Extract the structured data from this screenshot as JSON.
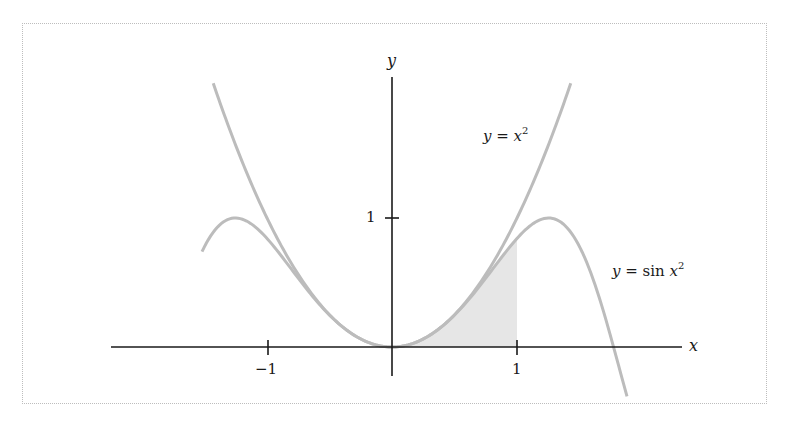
{
  "chart_data": {
    "type": "line",
    "title": "",
    "xlabel": "x",
    "ylabel": "y",
    "x_ticks": [
      -1,
      1
    ],
    "x_tick_labels": [
      "−1",
      "1"
    ],
    "y_ticks": [
      1
    ],
    "y_tick_labels": [
      "1"
    ],
    "xlim": [
      -2.25,
      2.32
    ],
    "ylim": [
      -0.23,
      2.1
    ],
    "grid": false,
    "legend": "none (curves labeled inline)",
    "series": [
      {
        "name": "y = x²",
        "function": "x^2",
        "x_range": [
          -1.43,
          1.43
        ],
        "color": "#b9b9b9",
        "points": [
          [
            -1.4,
            1.96
          ],
          [
            -1.0,
            1.0
          ],
          [
            -0.5,
            0.25
          ],
          [
            0,
            0
          ],
          [
            0.5,
            0.25
          ],
          [
            1.0,
            1.0
          ],
          [
            1.4,
            1.96
          ]
        ]
      },
      {
        "name": "y = sin x²",
        "function": "sin(x^2)",
        "x_range": [
          -1.52,
          1.88
        ],
        "color": "#b9b9b9",
        "points": [
          [
            -1.5,
            0.78
          ],
          [
            -1.25,
            1.0
          ],
          [
            -1.0,
            0.84
          ],
          [
            -0.5,
            0.25
          ],
          [
            0,
            0
          ],
          [
            0.5,
            0.25
          ],
          [
            1.0,
            0.84
          ],
          [
            1.25,
            1.0
          ],
          [
            1.5,
            0.78
          ],
          [
            1.77,
            0.0
          ],
          [
            1.88,
            -0.37
          ]
        ]
      }
    ],
    "shaded_region": {
      "description": "area under y = sin x² from x = 0 to x = 1",
      "x_from": 0,
      "x_to": 1,
      "color": "#e6e6e6"
    },
    "annotations": [
      {
        "text": "y = x²",
        "near": [
          0.9,
          1.6
        ]
      },
      {
        "text": "y = sin x²",
        "near": [
          1.95,
          0.6
        ]
      }
    ]
  },
  "labels": {
    "x_axis": "x",
    "y_axis": "y",
    "tick_x_neg1": "−1",
    "tick_x_1": "1",
    "tick_y_1": "1",
    "curve1_lhs": "y",
    "curve1_eq": " = ",
    "curve1_rhs": "x",
    "curve1_exp": "2",
    "curve2_lhs": "y",
    "curve2_eq": " = sin ",
    "curve2_rhs": "x",
    "curve2_exp": "2"
  }
}
